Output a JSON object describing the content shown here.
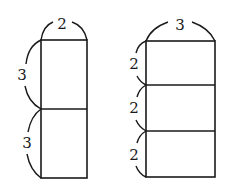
{
  "figures": [
    {
      "name": "left-stack",
      "width_label": "2",
      "segments": [
        {
          "height_label": "3"
        },
        {
          "height_label": "3"
        }
      ]
    },
    {
      "name": "right-stack",
      "width_label": "3",
      "segments": [
        {
          "height_label": "2"
        },
        {
          "height_label": "2"
        },
        {
          "height_label": "2"
        }
      ]
    }
  ],
  "colors": {
    "stroke": "#1a1a1a",
    "background": "#ffffff"
  }
}
